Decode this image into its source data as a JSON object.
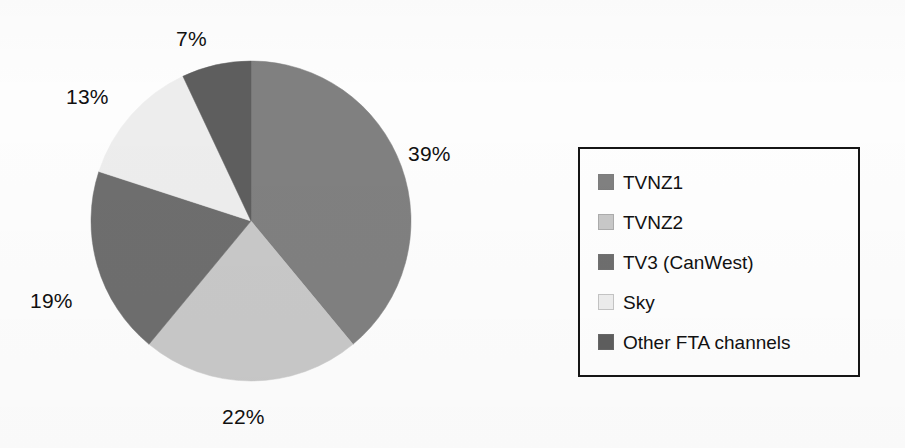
{
  "chart_data": {
    "type": "pie",
    "title": "",
    "labels": [
      "TVNZ1",
      "TVNZ2",
      "TV3 (CanWest)",
      "Sky",
      "Other FTA channels"
    ],
    "values": [
      39,
      22,
      19,
      13,
      7
    ],
    "value_labels": [
      "39%",
      "22%",
      "19%",
      "13%",
      "7%"
    ],
    "unit": "%",
    "total": 100,
    "start_angle_deg": 0,
    "direction": "clockwise",
    "legend_position": "right",
    "grid": false,
    "colors": [
      "#808080",
      "#c8c8c8",
      "#6e6e6e",
      "#ededed",
      "#5e5e5e"
    ],
    "slices": [
      {
        "label": "TVNZ1",
        "value": 39,
        "value_label": "39%",
        "color": "#808080"
      },
      {
        "label": "TVNZ2",
        "value": 22,
        "value_label": "22%",
        "color": "#c8c8c8"
      },
      {
        "label": "TV3 (CanWest)",
        "value": 19,
        "value_label": "19%",
        "color": "#6e6e6e"
      },
      {
        "label": "Sky",
        "value": 13,
        "value_label": "13%",
        "color": "#ededed"
      },
      {
        "label": "Other FTA channels",
        "value": 7,
        "value_label": "7%",
        "color": "#5e5e5e"
      }
    ]
  },
  "pie_labels": {
    "tvnz1": "39%",
    "tvnz2": "22%",
    "tv3": "19%",
    "sky": "13%",
    "other": "7%"
  },
  "legend": {
    "items": [
      {
        "label": "TVNZ1",
        "color": "#808080"
      },
      {
        "label": "TVNZ2",
        "color": "#c8c8c8"
      },
      {
        "label": "TV3 (CanWest)",
        "color": "#6e6e6e"
      },
      {
        "label": "Sky",
        "color": "#ededed"
      },
      {
        "label": "Other FTA channels",
        "color": "#5e5e5e"
      }
    ]
  }
}
